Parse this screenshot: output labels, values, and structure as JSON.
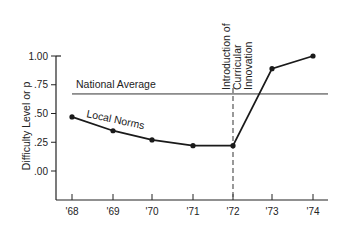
{
  "chart_data": {
    "type": "line",
    "title": "",
    "xlabel": "",
    "ylabel": "Difficulty Level or p",
    "categories": [
      "'68",
      "'69",
      "'70",
      "'71",
      "'72",
      "'73",
      "'74"
    ],
    "series": [
      {
        "name": "Local Norms",
        "values": [
          0.47,
          0.35,
          0.27,
          0.22,
          0.22,
          0.89,
          1.0
        ]
      }
    ],
    "reference_lines": [
      {
        "type": "horizontal",
        "label": "National Average",
        "value": 0.67
      },
      {
        "type": "vertical",
        "label": "Introduction of Curricular Innovation",
        "at": "'72",
        "style": "dashed"
      }
    ],
    "yticks": [
      ".00",
      ".25",
      ".50",
      ".75",
      "1.00"
    ],
    "ytick_values": [
      0.0,
      0.25,
      0.5,
      0.75,
      1.0
    ],
    "ylim": [
      -0.25,
      1.0
    ],
    "grid": false,
    "legend": "inline labels"
  },
  "labels": {
    "ylabel": "Difficulty Level or p",
    "national_average": "National Average",
    "local_norms": "Local Norms",
    "innovation_line1": "Introduction of",
    "innovation_line2": "Curricular",
    "innovation_line3": "Innovation"
  },
  "colors": {
    "line": "#1a1a1a",
    "reference": "#333333",
    "background": "#ffffff"
  }
}
